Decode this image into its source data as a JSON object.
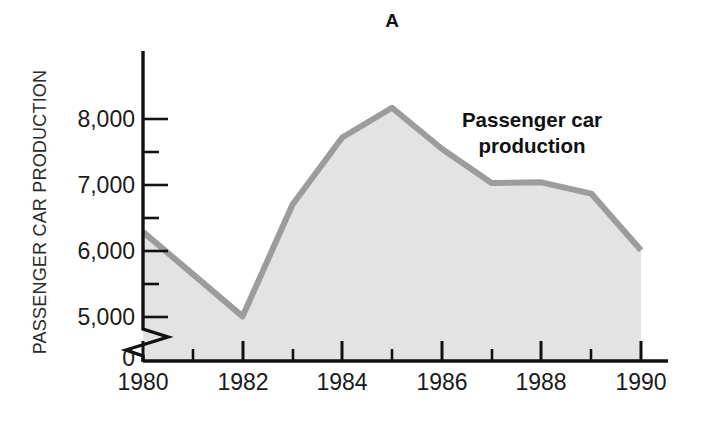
{
  "figure": {
    "panel_label": "A",
    "background_color": "#ffffff"
  },
  "annotation": {
    "line1": "Passenger car",
    "line2": "production"
  },
  "axes": {
    "y_title": "PASSENGER CAR PRODUCTION",
    "y_tick_labels": [
      "8,000",
      "7,000",
      "6,000",
      "5,000",
      "0"
    ],
    "x_tick_labels": [
      "1980",
      "1982",
      "1984",
      "1986",
      "1988",
      "1990"
    ]
  },
  "colors": {
    "line": "#9c9c9c",
    "fill": "#e3e3e3",
    "axis": "#111111",
    "text": "#1a1a1a"
  },
  "chart_data": {
    "type": "area",
    "title": "A",
    "xlabel": "",
    "ylabel": "PASSENGER CAR PRODUCTION",
    "x": [
      1980,
      1981,
      1982,
      1983,
      1984,
      1985,
      1986,
      1987,
      1988,
      1989,
      1990
    ],
    "values": [
      6290,
      5650,
      5010,
      6700,
      7720,
      8170,
      7550,
      7030,
      7040,
      6870,
      6010
    ],
    "series": [
      {
        "name": "Passenger car production",
        "values": [
          6290,
          5650,
          5010,
          6700,
          7720,
          8170,
          7550,
          7030,
          7040,
          6870,
          6010
        ]
      }
    ],
    "ylim": [
      5000,
      8500
    ],
    "y_major_ticks": [
      5000,
      6000,
      7000,
      8000
    ],
    "y_minor_ticks": [
      5500,
      6500,
      7500
    ],
    "y_axis_break": true,
    "y_break_label": "0",
    "xlim": [
      1980,
      1990
    ],
    "x_ticks": [
      1980,
      1981,
      1982,
      1983,
      1984,
      1985,
      1986,
      1987,
      1988,
      1989,
      1990
    ],
    "x_labeled_ticks": [
      1980,
      1982,
      1984,
      1986,
      1988,
      1990
    ],
    "grid": false,
    "legend": "annotation-inline",
    "legend_position": "upper-right"
  }
}
